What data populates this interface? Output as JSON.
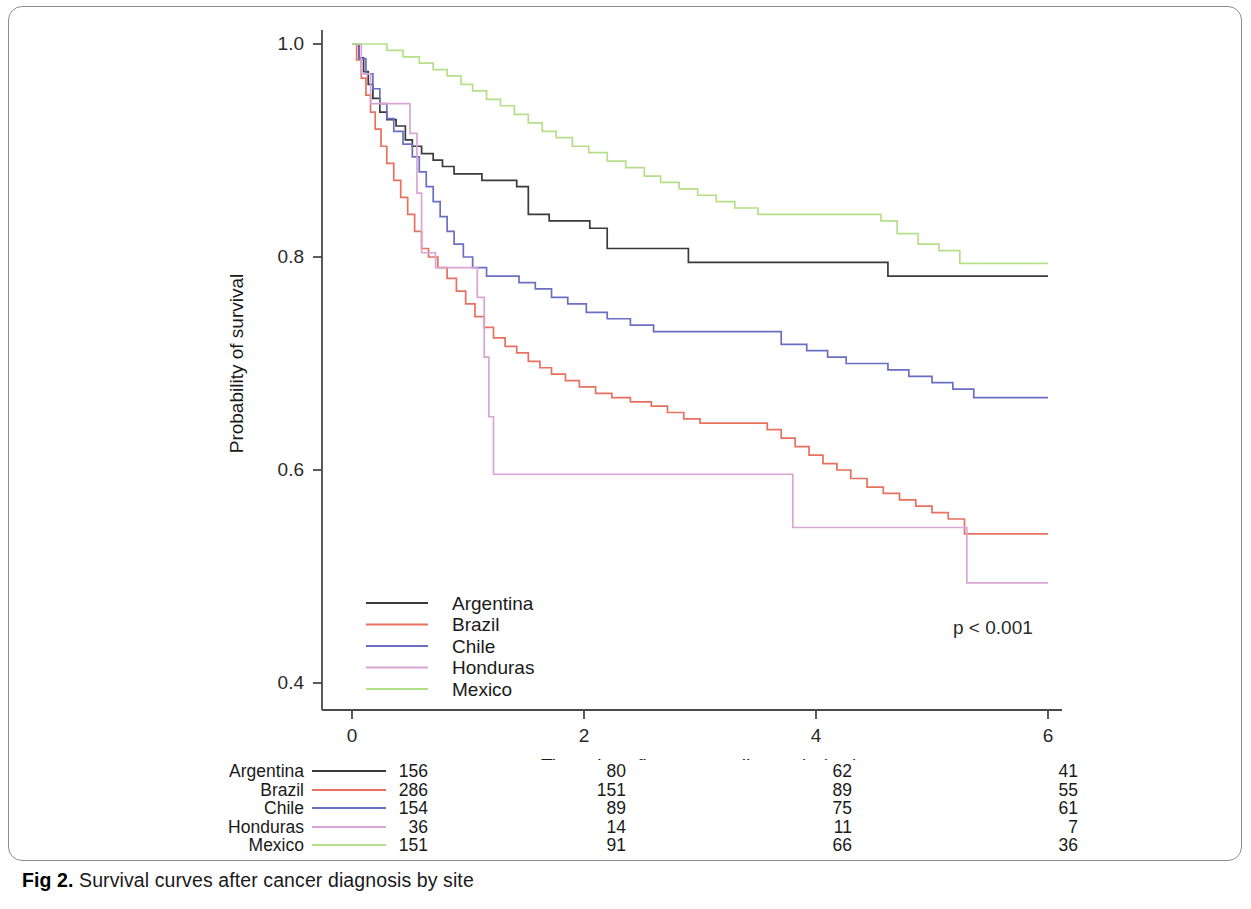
{
  "figure": {
    "caption_label": "Fig 2.",
    "caption_text": "Survival curves after cancer diagnosis by site"
  },
  "annotations": {
    "p_value": "p < 0.001"
  },
  "chart_data": {
    "type": "line",
    "subtype": "kaplan-meier-step",
    "title": "",
    "xlabel": "Time since first cancer diagnosis (yrs)",
    "ylabel": "Probability of survival",
    "xlim": [
      0,
      6
    ],
    "ylim": [
      0.4,
      1.0
    ],
    "xticks": [
      0,
      2,
      4,
      6
    ],
    "xtick_labels": [
      "0",
      "2",
      "4",
      "6"
    ],
    "yticks": [
      0.4,
      0.6,
      0.8,
      1.0
    ],
    "ytick_labels": [
      "0.4",
      "0.6",
      "0.8",
      "1.0"
    ],
    "grid": false,
    "legend_position": "lower-left-inside",
    "annotation": "p < 0.001",
    "series": [
      {
        "name": "Argentina",
        "color": "#3a3a3a",
        "points": [
          [
            0.0,
            1.0
          ],
          [
            0.06,
            0.987
          ],
          [
            0.1,
            0.974
          ],
          [
            0.14,
            0.962
          ],
          [
            0.18,
            0.949
          ],
          [
            0.24,
            0.936
          ],
          [
            0.3,
            0.929
          ],
          [
            0.38,
            0.923
          ],
          [
            0.46,
            0.91
          ],
          [
            0.52,
            0.904
          ],
          [
            0.6,
            0.897
          ],
          [
            0.7,
            0.891
          ],
          [
            0.78,
            0.885
          ],
          [
            0.88,
            0.878
          ],
          [
            1.0,
            0.878
          ],
          [
            1.12,
            0.872
          ],
          [
            1.3,
            0.872
          ],
          [
            1.42,
            0.866
          ],
          [
            1.52,
            0.84
          ],
          [
            1.7,
            0.834
          ],
          [
            1.9,
            0.834
          ],
          [
            2.05,
            0.827
          ],
          [
            2.2,
            0.808
          ],
          [
            2.5,
            0.808
          ],
          [
            2.7,
            0.808
          ],
          [
            2.9,
            0.795
          ],
          [
            3.4,
            0.795
          ],
          [
            3.9,
            0.795
          ],
          [
            4.4,
            0.795
          ],
          [
            4.62,
            0.782
          ],
          [
            5.2,
            0.782
          ],
          [
            5.8,
            0.782
          ],
          [
            6.0,
            0.782
          ]
        ]
      },
      {
        "name": "Brazil",
        "color": "#e8705f",
        "points": [
          [
            0.0,
            1.0
          ],
          [
            0.04,
            0.985
          ],
          [
            0.08,
            0.968
          ],
          [
            0.12,
            0.952
          ],
          [
            0.16,
            0.936
          ],
          [
            0.2,
            0.92
          ],
          [
            0.25,
            0.904
          ],
          [
            0.3,
            0.888
          ],
          [
            0.36,
            0.872
          ],
          [
            0.42,
            0.856
          ],
          [
            0.48,
            0.84
          ],
          [
            0.54,
            0.824
          ],
          [
            0.6,
            0.808
          ],
          [
            0.66,
            0.8
          ],
          [
            0.74,
            0.79
          ],
          [
            0.82,
            0.78
          ],
          [
            0.9,
            0.768
          ],
          [
            0.98,
            0.756
          ],
          [
            1.06,
            0.744
          ],
          [
            1.14,
            0.734
          ],
          [
            1.22,
            0.724
          ],
          [
            1.32,
            0.716
          ],
          [
            1.42,
            0.71
          ],
          [
            1.52,
            0.702
          ],
          [
            1.62,
            0.696
          ],
          [
            1.72,
            0.69
          ],
          [
            1.84,
            0.684
          ],
          [
            1.96,
            0.678
          ],
          [
            2.1,
            0.672
          ],
          [
            2.24,
            0.668
          ],
          [
            2.4,
            0.664
          ],
          [
            2.58,
            0.66
          ],
          [
            2.72,
            0.654
          ],
          [
            2.86,
            0.648
          ],
          [
            3.0,
            0.644
          ],
          [
            3.2,
            0.644
          ],
          [
            3.4,
            0.644
          ],
          [
            3.58,
            0.638
          ],
          [
            3.7,
            0.63
          ],
          [
            3.82,
            0.622
          ],
          [
            3.94,
            0.614
          ],
          [
            4.06,
            0.606
          ],
          [
            4.18,
            0.6
          ],
          [
            4.3,
            0.592
          ],
          [
            4.44,
            0.584
          ],
          [
            4.58,
            0.578
          ],
          [
            4.72,
            0.572
          ],
          [
            4.86,
            0.566
          ],
          [
            5.0,
            0.56
          ],
          [
            5.14,
            0.554
          ],
          [
            5.28,
            0.54
          ],
          [
            5.6,
            0.54
          ],
          [
            6.0,
            0.54
          ]
        ]
      },
      {
        "name": "Chile",
        "color": "#6b6fc4",
        "points": [
          [
            0.0,
            1.0
          ],
          [
            0.06,
            0.986
          ],
          [
            0.12,
            0.972
          ],
          [
            0.18,
            0.958
          ],
          [
            0.24,
            0.944
          ],
          [
            0.3,
            0.93
          ],
          [
            0.36,
            0.918
          ],
          [
            0.44,
            0.906
          ],
          [
            0.52,
            0.894
          ],
          [
            0.58,
            0.88
          ],
          [
            0.64,
            0.866
          ],
          [
            0.7,
            0.852
          ],
          [
            0.76,
            0.838
          ],
          [
            0.82,
            0.824
          ],
          [
            0.88,
            0.812
          ],
          [
            0.96,
            0.8
          ],
          [
            1.04,
            0.79
          ],
          [
            1.16,
            0.782
          ],
          [
            1.3,
            0.782
          ],
          [
            1.44,
            0.776
          ],
          [
            1.58,
            0.77
          ],
          [
            1.72,
            0.762
          ],
          [
            1.86,
            0.756
          ],
          [
            2.02,
            0.748
          ],
          [
            2.2,
            0.742
          ],
          [
            2.4,
            0.736
          ],
          [
            2.6,
            0.73
          ],
          [
            2.9,
            0.73
          ],
          [
            3.2,
            0.73
          ],
          [
            3.44,
            0.73
          ],
          [
            3.7,
            0.718
          ],
          [
            3.92,
            0.712
          ],
          [
            4.1,
            0.706
          ],
          [
            4.26,
            0.7
          ],
          [
            4.44,
            0.7
          ],
          [
            4.62,
            0.694
          ],
          [
            4.8,
            0.688
          ],
          [
            5.0,
            0.682
          ],
          [
            5.18,
            0.676
          ],
          [
            5.36,
            0.668
          ],
          [
            5.7,
            0.668
          ],
          [
            6.0,
            0.668
          ]
        ]
      },
      {
        "name": "Honduras",
        "color": "#d9a6d4",
        "points": [
          [
            0.0,
            1.0
          ],
          [
            0.08,
            0.972
          ],
          [
            0.16,
            0.944
          ],
          [
            0.3,
            0.944
          ],
          [
            0.42,
            0.944
          ],
          [
            0.5,
            0.916
          ],
          [
            0.56,
            0.86
          ],
          [
            0.6,
            0.804
          ],
          [
            0.72,
            0.79
          ],
          [
            0.86,
            0.79
          ],
          [
            1.0,
            0.79
          ],
          [
            1.08,
            0.762
          ],
          [
            1.14,
            0.706
          ],
          [
            1.18,
            0.65
          ],
          [
            1.22,
            0.596
          ],
          [
            1.6,
            0.596
          ],
          [
            2.2,
            0.596
          ],
          [
            2.8,
            0.596
          ],
          [
            3.4,
            0.596
          ],
          [
            3.76,
            0.596
          ],
          [
            3.8,
            0.546
          ],
          [
            4.2,
            0.546
          ],
          [
            4.6,
            0.546
          ],
          [
            5.0,
            0.546
          ],
          [
            5.26,
            0.546
          ],
          [
            5.3,
            0.494
          ],
          [
            5.7,
            0.494
          ],
          [
            6.0,
            0.494
          ]
        ]
      },
      {
        "name": "Mexico",
        "color": "#b5e08a",
        "points": [
          [
            0.0,
            1.0
          ],
          [
            0.18,
            1.0
          ],
          [
            0.3,
            0.994
          ],
          [
            0.44,
            0.988
          ],
          [
            0.58,
            0.982
          ],
          [
            0.7,
            0.976
          ],
          [
            0.82,
            0.97
          ],
          [
            0.94,
            0.962
          ],
          [
            1.04,
            0.956
          ],
          [
            1.16,
            0.948
          ],
          [
            1.28,
            0.942
          ],
          [
            1.4,
            0.934
          ],
          [
            1.52,
            0.926
          ],
          [
            1.64,
            0.918
          ],
          [
            1.76,
            0.912
          ],
          [
            1.9,
            0.904
          ],
          [
            2.04,
            0.898
          ],
          [
            2.2,
            0.89
          ],
          [
            2.36,
            0.884
          ],
          [
            2.52,
            0.876
          ],
          [
            2.66,
            0.87
          ],
          [
            2.82,
            0.864
          ],
          [
            2.98,
            0.858
          ],
          [
            3.14,
            0.852
          ],
          [
            3.3,
            0.846
          ],
          [
            3.5,
            0.84
          ],
          [
            3.76,
            0.84
          ],
          [
            4.0,
            0.84
          ],
          [
            4.3,
            0.84
          ],
          [
            4.56,
            0.834
          ],
          [
            4.7,
            0.822
          ],
          [
            4.88,
            0.812
          ],
          [
            5.06,
            0.806
          ],
          [
            5.24,
            0.794
          ],
          [
            5.6,
            0.794
          ],
          [
            6.0,
            0.794
          ]
        ]
      }
    ],
    "legend": [
      {
        "label": "Argentina",
        "color": "#3a3a3a"
      },
      {
        "label": "Brazil",
        "color": "#e8705f"
      },
      {
        "label": "Chile",
        "color": "#6b6fc4"
      },
      {
        "label": "Honduras",
        "color": "#d9a6d4"
      },
      {
        "label": "Mexico",
        "color": "#b5e08a"
      }
    ],
    "risk_table": {
      "time_points": [
        0,
        2,
        4,
        6
      ],
      "rows": [
        {
          "name": "Argentina",
          "color": "#3a3a3a",
          "counts": [
            "156",
            "80",
            "62",
            "41"
          ]
        },
        {
          "name": "Brazil",
          "color": "#e8705f",
          "counts": [
            "286",
            "151",
            "89",
            "55"
          ]
        },
        {
          "name": "Chile",
          "color": "#6b6fc4",
          "counts": [
            "154",
            "89",
            "75",
            "61"
          ]
        },
        {
          "name": "Honduras",
          "color": "#d9a6d4",
          "counts": [
            "36",
            "14",
            "11",
            "7"
          ]
        },
        {
          "name": "Mexico",
          "color": "#b5e08a",
          "counts": [
            "151",
            "91",
            "66",
            "36"
          ]
        }
      ]
    }
  }
}
